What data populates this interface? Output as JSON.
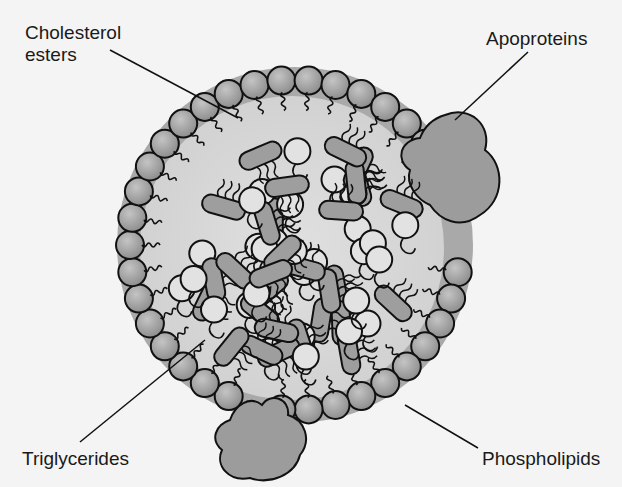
{
  "diagram": {
    "type": "lipoprotein-structure",
    "labels": {
      "cholesterol_esters_line1": "Cholesterol",
      "cholesterol_esters_line2": "esters",
      "apoproteins": "Apoproteins",
      "triglycerides": "Triglycerides",
      "phospholipids": "Phospholipids"
    },
    "colors": {
      "background": "#f4f4f4",
      "shell": "#a8a8a8",
      "core": "#d6d6d6",
      "phospholipid_head": "#9a9a9a",
      "apoprotein": "#9c9c9c",
      "triglyceride": "#9e9e9e",
      "outline": "#111111"
    }
  }
}
